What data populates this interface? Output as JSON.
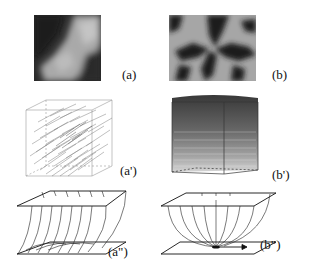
{
  "figure": {
    "panels": [
      {
        "id": "a",
        "label": "(a)",
        "kind": "grayscale-texture"
      },
      {
        "id": "b",
        "label": "(b)",
        "kind": "grayscale-texture"
      },
      {
        "id": "a_prime",
        "label": "(a')",
        "kind": "3d-vector-cube"
      },
      {
        "id": "b_prime",
        "label": "(b')",
        "kind": "3d-vector-cube"
      },
      {
        "id": "a_dprime",
        "label": "(a\")",
        "kind": "field-line-sketch"
      },
      {
        "id": "b_dprime",
        "label": "(b\")",
        "kind": "field-line-sketch"
      }
    ],
    "colors": {
      "background": "#ffffff",
      "ink": "#111111",
      "dark": "#1a1a1a",
      "light": "#bdbdbd",
      "cube_lines": "#8a8a8a"
    }
  }
}
